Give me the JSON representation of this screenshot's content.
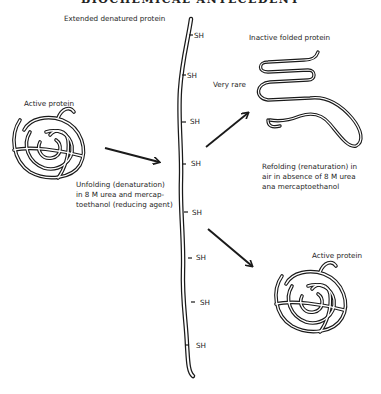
{
  "header": {
    "title": "BIOCHEMICAL ANTECEDENT"
  },
  "labels": {
    "extended": "Extended denatured protein",
    "active_left": "Active protein",
    "inactive": "Inactive folded protein",
    "very_rare": "Very rare",
    "unfolding": [
      "Unfolding (denaturation)",
      "in 8 M urea and mercap-",
      "toethanol (reducing agent)"
    ],
    "refolding": [
      "Refolding (renaturation) in",
      "air  in absence of 8 M urea",
      "ana mercaptoethanol"
    ],
    "active_right": "Active protein"
  },
  "sh_groups": [
    "SH",
    "SH",
    "SH",
    "SH",
    "SH",
    "SH",
    "SH",
    "SH"
  ],
  "colors": {
    "ink": "#1a1a1a",
    "background": "#ffffff"
  }
}
